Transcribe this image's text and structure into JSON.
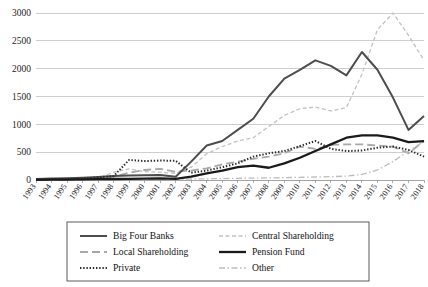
{
  "chart_data": {
    "type": "line",
    "title": "",
    "subtitle": "",
    "xlabel": "",
    "ylabel": "",
    "xlim": [
      1993,
      2018
    ],
    "ylim": [
      0,
      3000
    ],
    "yticks": [
      0,
      500,
      1000,
      1500,
      2000,
      2500,
      3000
    ],
    "grid": true,
    "legend_position": "bottom",
    "x": [
      1993,
      1994,
      1995,
      1996,
      1997,
      1998,
      1999,
      2000,
      2001,
      2002,
      2003,
      2004,
      2005,
      2006,
      2007,
      2008,
      2009,
      2010,
      2011,
      2012,
      2013,
      2014,
      2015,
      2016,
      2017,
      2018
    ],
    "categories": [
      "1993",
      "1994",
      "1995",
      "1996",
      "1997",
      "1998",
      "1999",
      "2000",
      "2001",
      "2002",
      "2003",
      "2004",
      "2005",
      "2006",
      "2007",
      "2008",
      "2009",
      "2010",
      "2011",
      "2012",
      "2013",
      "2014",
      "2015",
      "2016",
      "2017",
      "2018"
    ],
    "series": [
      {
        "name": "Big Four Banks",
        "color": "#4d4d4d",
        "dash": "none",
        "width": 2.0,
        "values": [
          20,
          25,
          30,
          40,
          55,
          70,
          80,
          85,
          90,
          60,
          330,
          620,
          700,
          900,
          1100,
          1500,
          1820,
          1980,
          2150,
          2050,
          1880,
          2300,
          1980,
          1480,
          900,
          1150
        ]
      },
      {
        "name": "Central Shareholding",
        "color": "#c2c2c2",
        "dash": "4,2.5",
        "width": 1.3,
        "values": [
          5,
          8,
          12,
          20,
          35,
          140,
          200,
          150,
          140,
          120,
          230,
          470,
          600,
          700,
          760,
          960,
          1160,
          1280,
          1310,
          1240,
          1300,
          1900,
          2700,
          3000,
          2600,
          2150
        ]
      },
      {
        "name": "Local Shareholding",
        "color": "#a8a8a8",
        "dash": "8,4",
        "width": 1.8,
        "values": [
          8,
          10,
          14,
          22,
          40,
          60,
          130,
          180,
          200,
          150,
          170,
          210,
          280,
          330,
          380,
          420,
          480,
          600,
          560,
          630,
          640,
          640,
          620,
          600,
          480,
          700
        ]
      },
      {
        "name": "Pension Fund",
        "color": "#1a1a1a",
        "dash": "none",
        "width": 2.3,
        "values": [
          4,
          5,
          7,
          10,
          14,
          18,
          22,
          25,
          28,
          22,
          60,
          120,
          170,
          230,
          260,
          220,
          300,
          400,
          520,
          640,
          760,
          800,
          800,
          760,
          680,
          700
        ]
      },
      {
        "name": "Private",
        "color": "#2b2b2b",
        "dash": "1.4,1.8",
        "width": 2.0,
        "values": [
          10,
          12,
          16,
          24,
          45,
          70,
          360,
          340,
          350,
          345,
          130,
          170,
          230,
          300,
          420,
          480,
          520,
          610,
          700,
          560,
          520,
          530,
          580,
          600,
          540,
          420
        ]
      },
      {
        "name": "Other",
        "color": "#bdbdbd",
        "dash": "6,2.5,1.5,2.5",
        "width": 1.3,
        "values": [
          2,
          3,
          4,
          5,
          7,
          9,
          12,
          14,
          16,
          14,
          18,
          22,
          26,
          30,
          34,
          38,
          42,
          48,
          54,
          60,
          70,
          100,
          180,
          330,
          520,
          690
        ]
      }
    ]
  },
  "legend": {
    "entries": [
      {
        "label": "Big Four Banks"
      },
      {
        "label": "Central Shareholding"
      },
      {
        "label": "Local Shareholding"
      },
      {
        "label": "Pension Fund"
      },
      {
        "label": "Private"
      },
      {
        "label": "Other"
      }
    ]
  }
}
